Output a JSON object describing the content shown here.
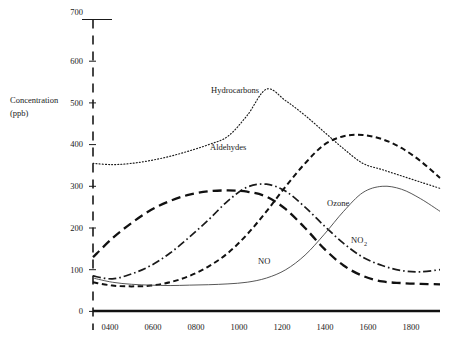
{
  "axis": {
    "y_title_line1": "Concentration",
    "y_title_line2": "(ppb)",
    "y_ticks": [
      "0",
      "100",
      "200",
      "300",
      "400",
      "500",
      "600",
      "700"
    ],
    "x_ticks": [
      "0400",
      "0600",
      "0800",
      "1000",
      "1200",
      "1400",
      "1600",
      "1800"
    ]
  },
  "labels": {
    "hydrocarbons": "Hydrocarbons",
    "aldehydes": "Aldehydes",
    "ozone": "Ozone",
    "no": "NO",
    "no2_main": "NO",
    "no2_sub": "2"
  },
  "colors": {
    "ink": "#1a1a1a",
    "thin": "#444444",
    "background": "#ffffff"
  },
  "chart_data": {
    "type": "line",
    "title": "",
    "subtitle": "",
    "xlabel": "",
    "ylabel": "Concentration (ppb)",
    "xlim": [
      200,
      2000
    ],
    "ylim": [
      0,
      700
    ],
    "grid": false,
    "legend": "inline-annotations",
    "x_tick_values": [
      400,
      600,
      800,
      1000,
      1200,
      1400,
      1600,
      1800
    ],
    "x_tick_labels": [
      "0400",
      "0600",
      "0800",
      "1000",
      "1200",
      "1400",
      "1600",
      "1800"
    ],
    "y_tick_values": [
      0,
      100,
      200,
      300,
      400,
      500,
      600,
      700
    ],
    "x": [
      200,
      300,
      400,
      500,
      600,
      700,
      800,
      900,
      1000,
      1100,
      1200,
      1300,
      1400,
      1500,
      1600,
      1700,
      1800,
      1900,
      2000
    ],
    "series": [
      {
        "name": "Hydrocarbons",
        "style": "dotted",
        "values": [
          355,
          352,
          355,
          362,
          372,
          385,
          400,
          420,
          470,
          533,
          505,
          470,
          430,
          390,
          355,
          340,
          325,
          310,
          295
        ]
      },
      {
        "name": "Aldehydes",
        "style": "dash-dot",
        "values": [
          85,
          78,
          90,
          110,
          140,
          178,
          220,
          265,
          298,
          305,
          288,
          250,
          205,
          163,
          130,
          110,
          98,
          95,
          100
        ]
      },
      {
        "name": "NO",
        "style": "long-dash",
        "values": [
          130,
          175,
          212,
          243,
          265,
          280,
          288,
          290,
          287,
          275,
          245,
          200,
          150,
          110,
          85,
          72,
          68,
          66,
          65
        ]
      },
      {
        "name": "NO2",
        "style": "dash",
        "values": [
          70,
          62,
          60,
          62,
          70,
          85,
          108,
          140,
          185,
          240,
          300,
          355,
          400,
          420,
          423,
          413,
          392,
          360,
          320
        ]
      },
      {
        "name": "Ozone",
        "style": "solid-thin",
        "values": [
          80,
          70,
          65,
          63,
          62,
          63,
          64,
          66,
          70,
          80,
          100,
          135,
          185,
          240,
          285,
          300,
          293,
          270,
          240
        ]
      }
    ],
    "annotations": [
      {
        "text": "Hydrocarbons",
        "x": 1100,
        "y": 520
      },
      {
        "text": "Aldehydes",
        "x": 1060,
        "y": 360
      },
      {
        "text": "Ozone",
        "x": 1500,
        "y": 262
      },
      {
        "text": "NO",
        "x": 1190,
        "y": 100
      },
      {
        "text": "NO2",
        "x": 1580,
        "y": 163
      }
    ]
  }
}
